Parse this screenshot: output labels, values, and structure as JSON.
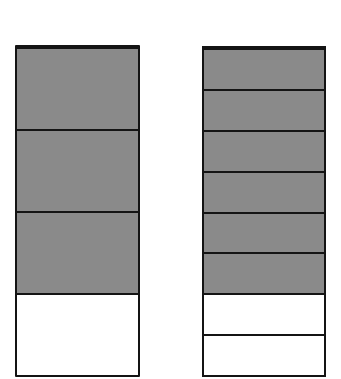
{
  "diagram": {
    "type": "fraction-bars",
    "colors": {
      "shaded": "#8a8a8a",
      "unshaded": "#ffffff",
      "outline": "#141414",
      "background": "#ffffff"
    },
    "bars": [
      {
        "id": "left",
        "parts": 4,
        "shaded": 3,
        "fraction": "3/4",
        "segments": [
          "shaded",
          "shaded",
          "shaded",
          "unshaded"
        ]
      },
      {
        "id": "right",
        "parts": 8,
        "shaded": 6,
        "fraction": "6/8",
        "segments": [
          "shaded",
          "shaded",
          "shaded",
          "shaded",
          "shaded",
          "shaded",
          "unshaded",
          "unshaded"
        ]
      }
    ]
  }
}
